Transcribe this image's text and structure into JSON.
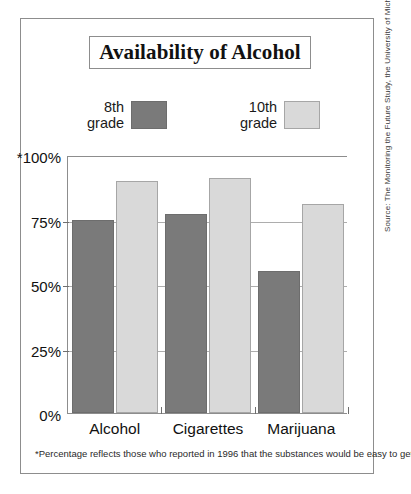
{
  "figure": {
    "title": "Availability of Alcohol",
    "footnote": "*Percentage reflects those who reported in 1996 that the substances would be easy to get.",
    "source": "Source: The Monitoring the Future Study, the University of Michigan"
  },
  "legend": {
    "entries": [
      {
        "label": "8th\ngrade",
        "color": "#7a7a7a",
        "series": "8th grade"
      },
      {
        "label": "10th\ngrade",
        "color": "#d9d9d9",
        "series": "10th grade"
      }
    ]
  },
  "axis": {
    "y_ticks": [
      "*100%",
      "75%",
      "50%",
      "25%",
      "0%"
    ],
    "x_ticks": [
      "Alcohol",
      "Cigarettes",
      "Marijuana"
    ]
  },
  "chart_data": {
    "type": "bar",
    "title": "Availability of Alcohol",
    "xlabel": "",
    "ylabel": "",
    "ylim": [
      0,
      100
    ],
    "yticks": [
      0,
      25,
      50,
      75,
      100
    ],
    "ytick_labels": [
      "0%",
      "25%",
      "50%",
      "75%",
      "*100%"
    ],
    "grid": true,
    "legend_position": "top",
    "categories": [
      "Alcohol",
      "Cigarettes",
      "Marijuana"
    ],
    "series": [
      {
        "name": "8th grade",
        "color": "#7a7a7a",
        "values": [
          75,
          77,
          55
        ]
      },
      {
        "name": "10th grade",
        "color": "#d9d9d9",
        "values": [
          90,
          91,
          81
        ]
      }
    ],
    "annotations": [
      "*Percentage reflects those who reported in 1996 that the substances would be easy to get."
    ],
    "source": "Source: The Monitoring the Future Study, the University of Michigan"
  }
}
